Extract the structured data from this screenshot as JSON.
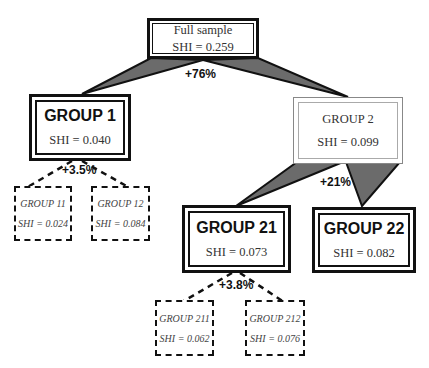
{
  "root": {
    "label": "Full sample",
    "shi": "SHI = 0.259"
  },
  "splits": [
    {
      "from": "root",
      "gain": "+76%"
    },
    {
      "from": "group1",
      "gain": "+3.5%"
    },
    {
      "from": "group2",
      "gain": "+21%"
    },
    {
      "from": "group21",
      "gain": "+3.8%"
    }
  ],
  "nodes": {
    "group1": {
      "label": "GROUP 1",
      "shi": "SHI = 0.040"
    },
    "group2": {
      "label": "GROUP 2",
      "shi": "SHI = 0.099"
    },
    "group11": {
      "label": "GROUP 11",
      "shi": "SHI = 0.024"
    },
    "group12": {
      "label": "GROUP 12",
      "shi": "SHI = 0.084"
    },
    "group21": {
      "label": "GROUP 21",
      "shi": "SHI = 0.073"
    },
    "group22": {
      "label": "GROUP 22",
      "shi": "SHI = 0.082"
    },
    "group211": {
      "label": "GROUP 211",
      "shi": "SHI = 0.062"
    },
    "group212": {
      "label": "GROUP 212",
      "shi": "SHI = 0.076"
    }
  },
  "colors": {
    "wedge": "#6b6b6b",
    "line": "#111111"
  }
}
